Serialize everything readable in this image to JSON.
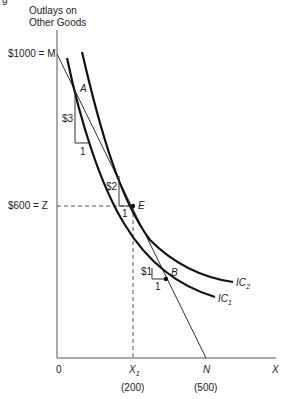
{
  "diagram": {
    "type": "indifference-curve-budget-line",
    "clipped_top_text": "g",
    "y_axis_title_line1": "Outlays on",
    "y_axis_title_line2": "Other Goods",
    "x_axis_label": "X",
    "origin_label": "0",
    "y_ticks": [
      {
        "label": "$1000 = M",
        "value": 1000
      },
      {
        "label": "$600 = Z",
        "value": 600
      }
    ],
    "x_ticks": [
      {
        "label": "X",
        "sub": "1",
        "value_label": "(200)",
        "value": 200
      },
      {
        "label": "N",
        "value_label": "(500)",
        "value": 500
      }
    ],
    "points": [
      {
        "name": "A"
      },
      {
        "name": "E"
      },
      {
        "name": "B"
      }
    ],
    "slope_triangles": [
      {
        "rise": "$3",
        "run": "1"
      },
      {
        "rise": "$2",
        "run": "1"
      },
      {
        "rise": "$1",
        "run": "1"
      }
    ],
    "curves": [
      {
        "name": "IC",
        "sub": "2"
      },
      {
        "name": "IC",
        "sub": "1"
      }
    ],
    "budget_line": {
      "from": "M",
      "to": "N"
    },
    "colors": {
      "ink": "#111111",
      "background": "#ffffff"
    }
  }
}
